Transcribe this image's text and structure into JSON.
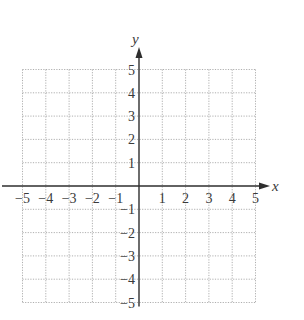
{
  "chart_data": {
    "type": "scatter",
    "title": "",
    "xlabel": "x",
    "ylabel": "y",
    "xlim": [
      -5,
      5
    ],
    "ylim": [
      -5,
      5
    ],
    "grid": true,
    "grid_style": "dotted",
    "x_ticks": [
      -5,
      -4,
      -3,
      -2,
      -1,
      1,
      2,
      3,
      4,
      5
    ],
    "y_ticks": [
      -5,
      -4,
      -3,
      -2,
      -1,
      1,
      2,
      3,
      4,
      5
    ],
    "x_tick_labels": [
      "−5",
      "−4",
      "−3",
      "−2",
      "−1",
      "1",
      "2",
      "3",
      "4",
      "5"
    ],
    "y_tick_labels": [
      "−5",
      "−4",
      "−3",
      "−2",
      "−1",
      "1",
      "2",
      "3",
      "4",
      "5"
    ],
    "series": [],
    "legend": null
  },
  "colors": {
    "axis": "#2e2e2e",
    "grid": "#9a9a9a",
    "text": "#3a3a3a"
  }
}
